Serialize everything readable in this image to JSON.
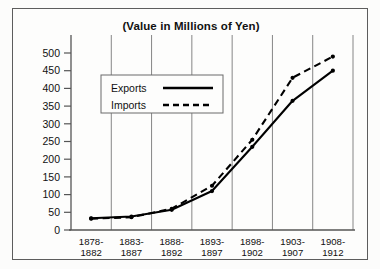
{
  "chart_data": {
    "type": "line",
    "title": "(Value in Millions of Yen)",
    "xlabel": "",
    "ylabel": "",
    "ylim": [
      0,
      500
    ],
    "yticks": [
      0,
      50,
      100,
      150,
      200,
      250,
      300,
      350,
      400,
      450,
      500
    ],
    "grid": true,
    "grid_orientation": "vertical",
    "legend_position": "upper-left-inside",
    "categories": [
      "1878-\n1882",
      "1883-\n1887",
      "1888-\n1892",
      "1893-\n1897",
      "1898-\n1902",
      "1903-\n1907",
      "1908-\n1912"
    ],
    "category_lines": [
      [
        "1878-",
        "1882"
      ],
      [
        "1883-",
        "1887"
      ],
      [
        "1888-",
        "1892"
      ],
      [
        "1893-",
        "1897"
      ],
      [
        "1898-",
        "1902"
      ],
      [
        "1903-",
        "1907"
      ],
      [
        "1908-",
        "1912"
      ]
    ],
    "series": [
      {
        "name": "Exports",
        "style": "solid",
        "color": "#000000",
        "values": [
          33,
          38,
          57,
          110,
          235,
          365,
          450
        ]
      },
      {
        "name": "Imports",
        "style": "dashed",
        "color": "#000000",
        "values": [
          32,
          36,
          60,
          125,
          255,
          430,
          490
        ]
      }
    ]
  },
  "legend": {
    "entries": [
      {
        "label": "Exports",
        "style": "solid"
      },
      {
        "label": "Imports",
        "style": "dashed"
      }
    ]
  }
}
